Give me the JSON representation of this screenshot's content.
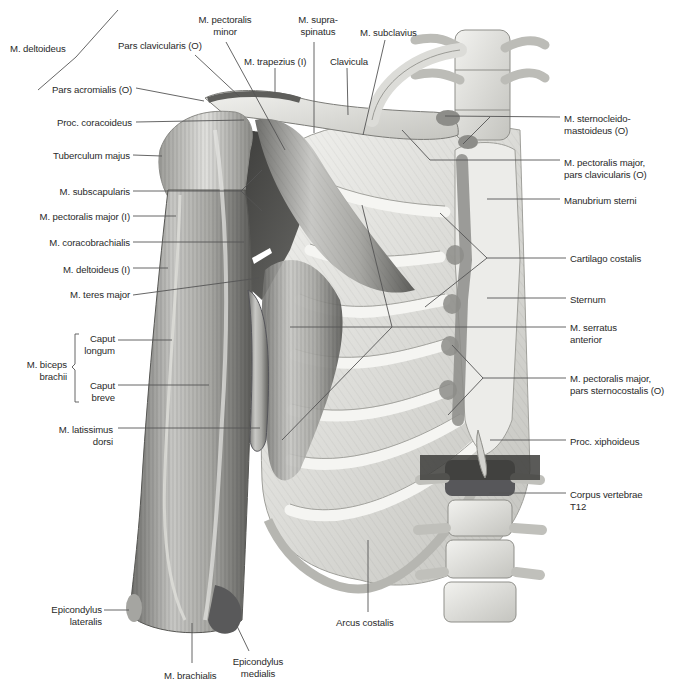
{
  "figure": {
    "leader_color": "#555555",
    "colors": {
      "bone": "#e6e6e3",
      "bone_shadow": "#b9b9b4",
      "muscle_light": "#c9c9c6",
      "muscle_mid": "#9a9a96",
      "muscle_dark": "#4a4a48",
      "origin_mark": "#8d8d89",
      "background": "#ffffff"
    }
  },
  "labels": [
    {
      "id": "m-deltoideus",
      "lines": [
        "M. deltoideus"
      ],
      "x": 10,
      "y": 43,
      "w": 80,
      "align": "l"
    },
    {
      "id": "pars-clavicularis-o",
      "lines": [
        "Pars clavicularis (O)"
      ],
      "x": 118,
      "y": 40,
      "w": 90,
      "align": "l"
    },
    {
      "id": "pars-acromialis-o",
      "lines": [
        "Pars acromialis (O)"
      ],
      "x": 52,
      "y": 84,
      "w": 80,
      "align": "l"
    },
    {
      "id": "proc-coracoideus",
      "lines": [
        "Proc. coracoideus"
      ],
      "x": 52,
      "y": 117,
      "w": 80,
      "align": "r"
    },
    {
      "id": "m-pectoralis-minor",
      "lines": [
        "M. pectoralis",
        "minor"
      ],
      "x": 195,
      "y": 14,
      "w": 60,
      "align": "c"
    },
    {
      "id": "m-supraspinatus",
      "lines": [
        "M. supra-",
        "spinatus"
      ],
      "x": 293,
      "y": 14,
      "w": 50,
      "align": "c"
    },
    {
      "id": "m-subclavius",
      "lines": [
        "M. subclavius"
      ],
      "x": 360,
      "y": 27,
      "w": 70,
      "align": "l"
    },
    {
      "id": "m-trapezius-i",
      "lines": [
        "M. trapezius (I)"
      ],
      "x": 244,
      "y": 56,
      "w": 75,
      "align": "l"
    },
    {
      "id": "clavicula",
      "lines": [
        "Clavicula"
      ],
      "x": 330,
      "y": 56,
      "w": 50,
      "align": "l"
    },
    {
      "id": "m-sternocleidomastoideus-o",
      "lines": [
        "M. sternocleido-",
        "mastoideus (O)"
      ],
      "x": 564,
      "y": 113,
      "w": 100,
      "align": "l"
    },
    {
      "id": "m-pectoralis-major-clav",
      "lines": [
        "M. pectoralis major,",
        "pars clavicularis (O)"
      ],
      "x": 564,
      "y": 157,
      "w": 110,
      "align": "l"
    },
    {
      "id": "manubrium-sterni",
      "lines": [
        "Manubrium sterni"
      ],
      "x": 564,
      "y": 195,
      "w": 100,
      "align": "l"
    },
    {
      "id": "tuberculum-majus",
      "lines": [
        "Tuberculum majus"
      ],
      "x": 42,
      "y": 150,
      "w": 88,
      "align": "r"
    },
    {
      "id": "m-subscapularis",
      "lines": [
        "M. subscapularis"
      ],
      "x": 42,
      "y": 186,
      "w": 88,
      "align": "r"
    },
    {
      "id": "m-pectoralis-major-i",
      "lines": [
        "M. pectoralis major (I)"
      ],
      "x": 12,
      "y": 211,
      "w": 118,
      "align": "r"
    },
    {
      "id": "m-coracobrachialis",
      "lines": [
        "M. coracobrachialis"
      ],
      "x": 32,
      "y": 237,
      "w": 98,
      "align": "r"
    },
    {
      "id": "m-deltoideus-i",
      "lines": [
        "M. deltoideus (I)"
      ],
      "x": 42,
      "y": 264,
      "w": 88,
      "align": "r"
    },
    {
      "id": "m-teres-major",
      "lines": [
        "M. teres major"
      ],
      "x": 42,
      "y": 289,
      "w": 88,
      "align": "r"
    },
    {
      "id": "cartilago-costalis",
      "lines": [
        "Cartilago costalis"
      ],
      "x": 570,
      "y": 253,
      "w": 100,
      "align": "l"
    },
    {
      "id": "sternum",
      "lines": [
        "Sternum"
      ],
      "x": 570,
      "y": 294,
      "w": 60,
      "align": "l"
    },
    {
      "id": "m-serratus-anterior",
      "lines": [
        "M. serratus",
        "anterior"
      ],
      "x": 570,
      "y": 322,
      "w": 80,
      "align": "l"
    },
    {
      "id": "m-pectoralis-major-stern",
      "lines": [
        "M. pectoralis major,",
        "pars sternocostalis (O)"
      ],
      "x": 570,
      "y": 373,
      "w": 110,
      "align": "l"
    },
    {
      "id": "m-biceps-brachii",
      "lines": [
        "M. biceps",
        "brachii"
      ],
      "x": 12,
      "y": 359,
      "w": 55,
      "align": "r"
    },
    {
      "id": "caput-longum",
      "lines": [
        "Caput",
        "longum"
      ],
      "x": 80,
      "y": 333,
      "w": 35,
      "align": "r"
    },
    {
      "id": "caput-breve",
      "lines": [
        "Caput",
        "breve"
      ],
      "x": 80,
      "y": 380,
      "w": 35,
      "align": "r"
    },
    {
      "id": "m-latissimus-dorsi",
      "lines": [
        "M. latissimus",
        "dorsi"
      ],
      "x": 30,
      "y": 424,
      "w": 83,
      "align": "r"
    },
    {
      "id": "proc-xiphoideus",
      "lines": [
        "Proc. xiphoideus"
      ],
      "x": 570,
      "y": 436,
      "w": 90,
      "align": "l"
    },
    {
      "id": "corpus-vertebrae-t12",
      "lines": [
        "Corpus vertebrae",
        "T12"
      ],
      "x": 570,
      "y": 489,
      "w": 90,
      "align": "l"
    },
    {
      "id": "epicondylus-lateralis",
      "lines": [
        "Epicondylus",
        "lateralis"
      ],
      "x": 30,
      "y": 604,
      "w": 72,
      "align": "r"
    },
    {
      "id": "arcus-costalis",
      "lines": [
        "Arcus costalis"
      ],
      "x": 336,
      "y": 617,
      "w": 80,
      "align": "l"
    },
    {
      "id": "epicondylus-medialis",
      "lines": [
        "Epicondylus",
        "medialis"
      ],
      "x": 228,
      "y": 656,
      "w": 60,
      "align": "c"
    },
    {
      "id": "m-brachialis",
      "lines": [
        "M. brachialis"
      ],
      "x": 164,
      "y": 670,
      "w": 70,
      "align": "l"
    }
  ],
  "leaders": [
    {
      "for": "m-deltoideus",
      "points": [
        [
          38,
          90
        ],
        [
          76,
          57
        ],
        [
          118,
          10
        ]
      ]
    },
    {
      "for": "pars-clavicularis-o",
      "points": [
        [
          195,
          55
        ],
        [
          240,
          97
        ]
      ]
    },
    {
      "for": "pars-acromialis-o",
      "points": [
        [
          136,
          88
        ],
        [
          204,
          101
        ]
      ]
    },
    {
      "for": "proc-coracoideus",
      "points": [
        [
          136,
          122
        ],
        [
          244,
          120
        ]
      ]
    },
    {
      "for": "m-pectoralis-minor",
      "points": [
        [
          226,
          42
        ],
        [
          285,
          150
        ]
      ]
    },
    {
      "for": "m-trapezius-i",
      "points": [
        [
          275,
          68
        ],
        [
          275,
          93
        ]
      ]
    },
    {
      "for": "m-supraspinatus",
      "points": [
        [
          314,
          42
        ],
        [
          314,
          133
        ]
      ]
    },
    {
      "for": "clavicula",
      "points": [
        [
          347,
          68
        ],
        [
          348,
          115
        ]
      ]
    },
    {
      "for": "m-subclavius",
      "points": [
        [
          385,
          40
        ],
        [
          363,
          135
        ]
      ]
    },
    {
      "for": "m-sternocleidomastoideus-o",
      "points": [
        [
          560,
          117
        ],
        [
          445,
          116
        ]
      ]
    },
    {
      "for": "m-sternocleidomastoideus-o",
      "points": [
        [
          490,
          117
        ],
        [
          463,
          144
        ]
      ]
    },
    {
      "for": "m-pectoralis-major-clav",
      "points": [
        [
          560,
          160
        ],
        [
          430,
          160
        ],
        [
          402,
          130
        ]
      ]
    },
    {
      "for": "manubrium-sterni",
      "points": [
        [
          560,
          199
        ],
        [
          487,
          199
        ]
      ]
    },
    {
      "for": "tuberculum-majus",
      "points": [
        [
          133,
          155
        ],
        [
          162,
          156
        ]
      ]
    },
    {
      "for": "m-subscapularis",
      "points": [
        [
          133,
          191
        ],
        [
          241,
          191
        ]
      ]
    },
    {
      "for": "m-subscapularis",
      "points": [
        [
          241,
          191
        ],
        [
          262,
          170
        ]
      ]
    },
    {
      "for": "m-subscapularis",
      "points": [
        [
          241,
          191
        ],
        [
          262,
          211
        ]
      ]
    },
    {
      "for": "m-pectoralis-major-i",
      "points": [
        [
          133,
          216
        ],
        [
          176,
          216
        ]
      ]
    },
    {
      "for": "m-coracobrachialis",
      "points": [
        [
          133,
          242
        ],
        [
          244,
          242
        ]
      ]
    },
    {
      "for": "m-deltoideus-i",
      "points": [
        [
          133,
          268
        ],
        [
          168,
          268
        ]
      ]
    },
    {
      "for": "m-teres-major",
      "points": [
        [
          133,
          295
        ],
        [
          259,
          278
        ]
      ]
    },
    {
      "for": "cartilago-costalis",
      "points": [
        [
          566,
          258
        ],
        [
          487,
          258
        ],
        [
          440,
          213
        ]
      ]
    },
    {
      "for": "cartilago-costalis",
      "points": [
        [
          487,
          258
        ],
        [
          425,
          307
        ]
      ]
    },
    {
      "for": "sternum",
      "points": [
        [
          566,
          298
        ],
        [
          487,
          298
        ]
      ]
    },
    {
      "for": "m-serratus-anterior",
      "points": [
        [
          566,
          327
        ],
        [
          290,
          327
        ]
      ]
    },
    {
      "for": "m-serratus-anterior",
      "points": [
        [
          392,
          327
        ],
        [
          362,
          205
        ]
      ]
    },
    {
      "for": "m-serratus-anterior",
      "points": [
        [
          392,
          327
        ],
        [
          282,
          440
        ]
      ]
    },
    {
      "for": "m-pectoralis-major-stern",
      "points": [
        [
          566,
          378
        ],
        [
          483,
          378
        ],
        [
          452,
          345
        ]
      ]
    },
    {
      "for": "m-pectoralis-major-stern",
      "points": [
        [
          483,
          378
        ],
        [
          448,
          415
        ]
      ]
    },
    {
      "for": "caput-longum",
      "points": [
        [
          118,
          340
        ],
        [
          172,
          340
        ]
      ]
    },
    {
      "for": "caput-breve",
      "points": [
        [
          118,
          385
        ],
        [
          209,
          385
        ]
      ]
    },
    {
      "for": "m-latissimus-dorsi",
      "points": [
        [
          118,
          428
        ],
        [
          260,
          428
        ]
      ]
    },
    {
      "for": "proc-xiphoideus",
      "points": [
        [
          566,
          440
        ],
        [
          490,
          440
        ]
      ]
    },
    {
      "for": "corpus-vertebrae-t12",
      "points": [
        [
          566,
          493
        ],
        [
          489,
          493
        ]
      ]
    },
    {
      "for": "epicondylus-lateralis",
      "points": [
        [
          104,
          610
        ],
        [
          129,
          610
        ]
      ]
    },
    {
      "for": "arcus-costalis",
      "points": [
        [
          368,
          612
        ],
        [
          368,
          540
        ]
      ]
    },
    {
      "for": "epicondylus-medialis",
      "points": [
        [
          249,
          651
        ],
        [
          236,
          624
        ]
      ]
    },
    {
      "for": "m-brachialis",
      "points": [
        [
          192,
          663
        ],
        [
          192,
          623
        ]
      ]
    }
  ],
  "brackets": [
    {
      "for": "m-biceps-brachii",
      "x": 75,
      "y1": 334,
      "y2": 402,
      "tip_y": 367
    }
  ]
}
